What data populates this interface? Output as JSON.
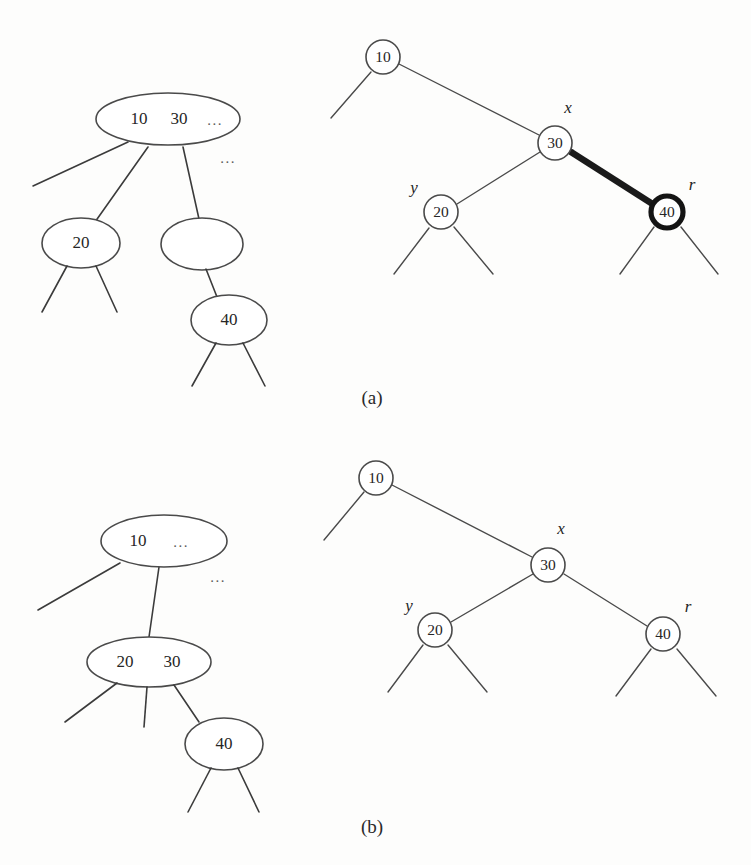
{
  "figure": {
    "background_color": "#fdfdfc",
    "stroke_color": "#4a4a4a",
    "bold_stroke_color": "#141414",
    "ellipsis": "...",
    "panels": [
      {
        "id": "a",
        "caption": "(a)",
        "btree": {
          "name": "btree-before",
          "nodes": [
            {
              "id": "a-root",
              "keys": [
                "10",
                "30"
              ],
              "trailing_ellipsis": "..."
            },
            {
              "id": "a-child1",
              "keys": [
                "20"
              ],
              "trailing_ellipsis": ""
            },
            {
              "id": "a-child2",
              "keys": [],
              "trailing_ellipsis": ""
            },
            {
              "id": "a-child3",
              "keys": [
                "40"
              ],
              "trailing_ellipsis": ""
            }
          ],
          "side_ellipsis": "..."
        },
        "bintree": {
          "name": "bintree-before",
          "nodes": [
            {
              "id": "a-bin-10",
              "value": "10",
              "label": "",
              "highlighted": false
            },
            {
              "id": "a-bin-30",
              "value": "30",
              "label": "x",
              "highlighted": false
            },
            {
              "id": "a-bin-20",
              "value": "20",
              "label": "y",
              "highlighted": false
            },
            {
              "id": "a-bin-40",
              "value": "40",
              "label": "r",
              "highlighted": true
            }
          ],
          "bold_edge": {
            "from": "a-bin-30",
            "to": "a-bin-40"
          }
        }
      },
      {
        "id": "b",
        "caption": "(b)",
        "btree": {
          "name": "btree-after",
          "nodes": [
            {
              "id": "b-root",
              "keys": [
                "10"
              ],
              "trailing_ellipsis": "..."
            },
            {
              "id": "b-child1",
              "keys": [
                "20",
                "30"
              ],
              "trailing_ellipsis": ""
            },
            {
              "id": "b-child2",
              "keys": [
                "40"
              ],
              "trailing_ellipsis": ""
            }
          ],
          "side_ellipsis": "..."
        },
        "bintree": {
          "name": "bintree-after",
          "nodes": [
            {
              "id": "b-bin-10",
              "value": "10",
              "label": "",
              "highlighted": false
            },
            {
              "id": "b-bin-30",
              "value": "30",
              "label": "x",
              "highlighted": false
            },
            {
              "id": "b-bin-20",
              "value": "20",
              "label": "y",
              "highlighted": false
            },
            {
              "id": "b-bin-40",
              "value": "40",
              "label": "r",
              "highlighted": false
            }
          ],
          "bold_edge": null
        }
      }
    ]
  },
  "labels": {
    "x": "x",
    "y": "y",
    "r": "r",
    "caption_a": "(a)",
    "caption_b": "(b)",
    "ellipsis": "...",
    "k10": "10",
    "k20": "20",
    "k30": "30",
    "k40": "40"
  }
}
